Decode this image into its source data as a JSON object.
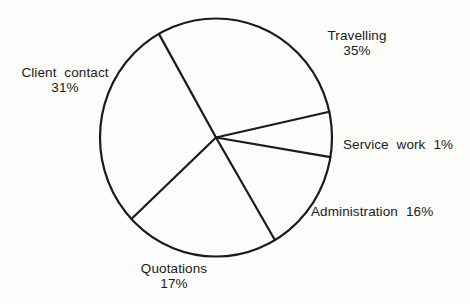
{
  "figure": {
    "labels": {
      "travelling": {
        "name": "Travelling",
        "pct": "35%"
      },
      "client_contact": {
        "name": "Client contact",
        "pct": "31%"
      },
      "service_work": {
        "name": "Service work",
        "pct": "1%"
      },
      "administration": {
        "name": "Administration",
        "pct": "16%"
      },
      "quotations": {
        "name": "Quotations",
        "pct": "17%"
      }
    }
  },
  "chart_data": {
    "type": "pie",
    "categories": [
      "Travelling",
      "Client contact",
      "Quotations",
      "Administration",
      "Service work"
    ],
    "values": [
      35,
      31,
      17,
      16,
      1
    ],
    "unit": "%",
    "title": "",
    "legend": "none",
    "style": {
      "fill": "none",
      "stroke": "#1a1a1a",
      "background": "#fcfcfb"
    },
    "layout": {
      "cx": 216,
      "cy": 137.5,
      "rx": 116,
      "ry": 119,
      "boundary_angles_deg": [
        119.5,
        12.5,
        -9.5,
        -59.5,
        -136.8
      ]
    }
  }
}
